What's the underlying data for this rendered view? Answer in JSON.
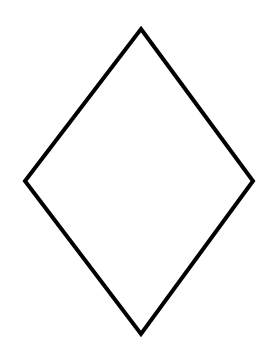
{
  "diagram": {
    "shape": "rhombus",
    "vertices": {
      "top": [
        141,
        29
      ],
      "right": [
        253,
        181
      ],
      "bottom": [
        141,
        334
      ],
      "left": [
        25,
        181
      ]
    },
    "stroke_color": "#000000",
    "fill_color": "#ffffff",
    "stroke_width": 4,
    "background_color": "#ffffff"
  }
}
